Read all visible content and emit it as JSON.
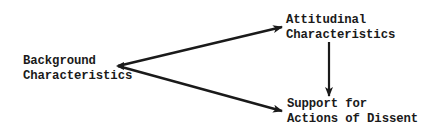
{
  "diagram": {
    "type": "path-diagram",
    "nodes": [
      {
        "id": "background",
        "lines": [
          "Background",
          "Characteristics"
        ]
      },
      {
        "id": "attitudinal",
        "lines": [
          "Attitudinal",
          "Characteristics"
        ]
      },
      {
        "id": "support",
        "lines": [
          "Support for",
          "Actions of Dissent"
        ]
      }
    ],
    "edges": [
      {
        "from": "background",
        "to": "attitudinal"
      },
      {
        "from": "background",
        "to": "support"
      },
      {
        "from": "attitudinal",
        "to": "support"
      }
    ],
    "colors": {
      "ink": "#1a1a1a",
      "background": "#ffffff"
    }
  }
}
